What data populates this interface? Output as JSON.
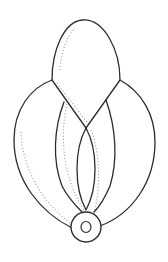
{
  "figure": {
    "type": "line-drawing",
    "colors": {
      "stroke": "#2b2b2b",
      "hatching": "#9a9a9a",
      "background": "#ffffff"
    },
    "parts": [
      "top-petal",
      "left-outer-segment",
      "right-outer-segment",
      "left-inner-segment",
      "right-inner-segment",
      "center-segment",
      "base-ring"
    ]
  }
}
